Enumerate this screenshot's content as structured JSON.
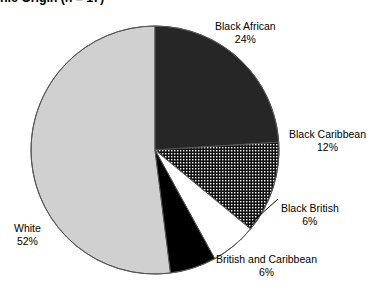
{
  "chart_data": {
    "type": "pie",
    "title": "nic Origin (n = 17)",
    "title_note": "clipped at top edge of screenshot",
    "xlabel": "",
    "ylabel": "",
    "legend": "none (direct labels)",
    "grid": false,
    "total_n": 17,
    "categories": [
      "Black African",
      "Black Caribbean",
      "Black British",
      "British and Caribbean",
      "White"
    ],
    "values": [
      24,
      12,
      6,
      6,
      52
    ],
    "value_labels": [
      "24%",
      "12%",
      "6%",
      "6%",
      "52%"
    ],
    "units": "percent",
    "start_angle_deg": 0,
    "direction": "clockwise",
    "slices": [
      {
        "name": "Black African",
        "value": 24,
        "value_label": "24%",
        "fill": "#262626",
        "pattern": "solid",
        "label_position": "outside-top-right"
      },
      {
        "name": "Black Caribbean",
        "value": 12,
        "value_label": "12%",
        "fill": "#2b2b2b",
        "pattern": "checkered-dots",
        "label_position": "outside-right"
      },
      {
        "name": "Black British",
        "value": 6,
        "value_label": "6%",
        "fill": "#ffffff",
        "pattern": "solid",
        "label_position": "outside-right-lower"
      },
      {
        "name": "British and Caribbean",
        "value": 6,
        "value_label": "6%",
        "fill": "#000000",
        "pattern": "solid",
        "label_position": "outside-bottom-right"
      },
      {
        "name": "White",
        "value": 52,
        "value_label": "52%",
        "fill": "#d0d0d0",
        "pattern": "solid",
        "label_position": "inside-left"
      }
    ],
    "colors": {
      "black_african": "#262626",
      "black_caribbean": "#2b2b2b",
      "black_british": "#ffffff",
      "british_and_caribbean": "#000000",
      "white": "#d0d0d0",
      "outline": "#555555",
      "text": "#000000",
      "background": "#ffffff"
    }
  },
  "labels": {
    "black_african": {
      "name": "Black African",
      "pct": "24%"
    },
    "black_caribbean": {
      "name": "Black Caribbean",
      "pct": "12%"
    },
    "black_british": {
      "name": "Black British",
      "pct": "6%"
    },
    "british_caribbean": {
      "name": "British and Caribbean",
      "pct": "6%"
    },
    "white": {
      "name": "White",
      "pct": "52%"
    }
  }
}
